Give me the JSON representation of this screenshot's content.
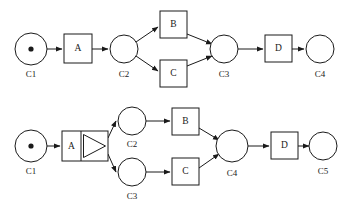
{
  "figure": {
    "background_color": "#ffffff",
    "stroke_color": "#1a1a1a",
    "width": 350,
    "height": 211
  },
  "diagrams": [
    {
      "id": "top-net",
      "name": "implicit-and-split-net",
      "places": [
        {
          "id": "t-c1",
          "label": "C1",
          "cx": 31,
          "cy": 49,
          "r": 16,
          "has_token": true,
          "label_x": 31,
          "label_y": 77
        },
        {
          "id": "t-c2",
          "label": "C2",
          "cx": 124,
          "cy": 49,
          "r": 14,
          "has_token": false,
          "label_x": 124,
          "label_y": 77
        },
        {
          "id": "t-c3",
          "label": "C3",
          "cx": 224,
          "cy": 49,
          "r": 14,
          "has_token": false,
          "label_x": 224,
          "label_y": 77
        },
        {
          "id": "t-c4",
          "label": "C4",
          "cx": 320,
          "cy": 49,
          "r": 14,
          "has_token": false,
          "label_x": 320,
          "label_y": 77
        }
      ],
      "transitions": [
        {
          "id": "t-a",
          "label": "A",
          "x": 64,
          "y": 34,
          "w": 28,
          "h": 29,
          "split": false
        },
        {
          "id": "t-b",
          "label": "B",
          "x": 160,
          "y": 11,
          "w": 27,
          "h": 27,
          "split": false
        },
        {
          "id": "t-c",
          "label": "C",
          "x": 160,
          "y": 60,
          "w": 27,
          "h": 27,
          "split": false
        },
        {
          "id": "t-d",
          "label": "D",
          "x": 265,
          "y": 35,
          "w": 27,
          "h": 27,
          "split": false
        }
      ],
      "edges": [
        {
          "from": "t-c1",
          "to": "t-a",
          "path": "M47,49 L62,49"
        },
        {
          "from": "t-a",
          "to": "t-c2",
          "path": "M92,49 L108,49"
        },
        {
          "from": "t-c2",
          "to": "t-b",
          "path": "M136,42 L158,27"
        },
        {
          "from": "t-c2",
          "to": "t-c",
          "path": "M136,56 L158,71"
        },
        {
          "from": "t-b",
          "to": "t-c3",
          "path": "M187,34 L212,44"
        },
        {
          "from": "t-c",
          "to": "t-c3",
          "path": "M187,66 L212,56"
        },
        {
          "from": "t-c3",
          "to": "t-d",
          "path": "M238,49 L263,49"
        },
        {
          "from": "t-d",
          "to": "t-c4",
          "path": "M292,49 L304,49"
        }
      ]
    },
    {
      "id": "bottom-net",
      "name": "explicit-and-split-net",
      "places": [
        {
          "id": "b-c1",
          "label": "C1",
          "cx": 31,
          "cy": 146,
          "r": 16,
          "has_token": true,
          "label_x": 31,
          "label_y": 174
        },
        {
          "id": "b-c2",
          "label": "C2",
          "cx": 132,
          "cy": 121,
          "r": 14,
          "has_token": false,
          "label_x": 132,
          "label_y": 147
        },
        {
          "id": "b-c3",
          "label": "C3",
          "cx": 132,
          "cy": 172,
          "r": 14,
          "has_token": false,
          "label_x": 132,
          "label_y": 199
        },
        {
          "id": "b-c4",
          "label": "C4",
          "cx": 232,
          "cy": 146,
          "r": 16,
          "has_token": false,
          "label_x": 232,
          "label_y": 176
        },
        {
          "id": "b-c5",
          "label": "C5",
          "cx": 323,
          "cy": 146,
          "r": 14,
          "has_token": false,
          "label_x": 323,
          "label_y": 174
        }
      ],
      "transitions": [
        {
          "id": "b-a",
          "label": "A",
          "x": 62,
          "y": 131,
          "w": 46,
          "h": 30,
          "split": true,
          "split_divider_x": 81
        },
        {
          "id": "b-b",
          "label": "B",
          "x": 172,
          "y": 108,
          "w": 27,
          "h": 27,
          "split": false
        },
        {
          "id": "b-c",
          "label": "C",
          "x": 172,
          "y": 158,
          "w": 27,
          "h": 27,
          "split": false
        },
        {
          "id": "b-d",
          "label": "D",
          "x": 271,
          "y": 132,
          "w": 27,
          "h": 27,
          "split": false
        }
      ],
      "edges": [
        {
          "from": "b-c1",
          "to": "b-a",
          "path": "M47,146 L60,146"
        },
        {
          "from": "b-a",
          "to": "b-c2",
          "path": "M108,138 L116,121"
        },
        {
          "from": "b-a",
          "to": "b-c3",
          "path": "M108,154 L116,172"
        },
        {
          "from": "b-c2",
          "to": "b-b",
          "path": "M146,121 L170,121"
        },
        {
          "from": "b-c3",
          "to": "b-c",
          "path": "M146,172 L170,172"
        },
        {
          "from": "b-b",
          "to": "b-c4",
          "path": "M199,128 L219,140"
        },
        {
          "from": "b-c",
          "to": "b-c4",
          "path": "M199,168 L219,154"
        },
        {
          "from": "b-c4",
          "to": "b-d",
          "path": "M248,146 L269,146"
        },
        {
          "from": "b-d",
          "to": "b-c5",
          "path": "M298,146 L309,146"
        }
      ]
    }
  ]
}
